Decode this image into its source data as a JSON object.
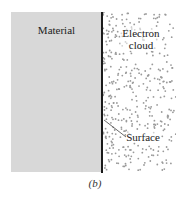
{
  "figure": {
    "caption": "(b)",
    "material": {
      "label": "Material",
      "fill": "#d8d8d8"
    },
    "electron_cloud": {
      "label_line1": "Electron",
      "label_line2": "cloud",
      "dot_color": "#9a9a9a"
    },
    "surface": {
      "label": "Surface",
      "line_color": "#1a1a1a"
    }
  }
}
